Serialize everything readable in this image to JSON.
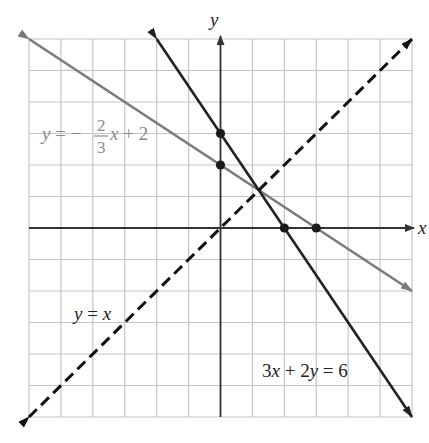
{
  "chart_data": {
    "type": "line",
    "title": "",
    "xlabel": "x",
    "ylabel": "y",
    "xlim": [
      -6,
      6
    ],
    "ylim": [
      -6,
      6
    ],
    "grid": true,
    "grid_step": 1,
    "legend": "inline labels",
    "series": [
      {
        "name": "y = -2/3 x + 2",
        "label_parts": {
          "lhs": "y",
          "eq": " = −",
          "num": "2",
          "den": "3",
          "rhs_var": "x",
          "rhs": " + 2"
        },
        "style": "solid",
        "color": "#7a7a7a",
        "x": [
          -6,
          6
        ],
        "y": [
          6,
          -2
        ]
      },
      {
        "name": "3x + 2y = 6",
        "label_parts": {
          "a": "3",
          "v1": "x",
          "mid": " + 2",
          "v2": "y",
          "end": " = 6"
        },
        "style": "solid",
        "color": "#222222",
        "x": [
          -2,
          6
        ],
        "y": [
          6,
          -6
        ]
      },
      {
        "name": "y = x",
        "label_parts": {
          "lhs": "y",
          "eq": " = ",
          "rhs": "x"
        },
        "style": "dashed",
        "color": "#111111",
        "x": [
          -6,
          6
        ],
        "y": [
          -6,
          6
        ]
      }
    ],
    "points": [
      {
        "x": 0,
        "y": 3
      },
      {
        "x": 0,
        "y": 2
      },
      {
        "x": 2,
        "y": 0
      },
      {
        "x": 3,
        "y": 0
      }
    ]
  },
  "colors": {
    "grid": "#c4c4c4",
    "axis": "#333333",
    "background": "#ffffff",
    "point": "#1a1a1a"
  }
}
